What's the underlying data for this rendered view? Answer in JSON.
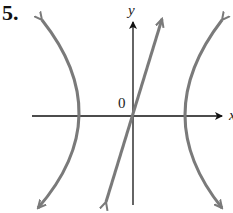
{
  "problem_number": "5.",
  "axes": {
    "x_label": "x",
    "y_label": "y",
    "origin_label": "0"
  },
  "figure": {
    "curve_color": "#7a7a7a",
    "axis_color": "#111111"
  }
}
